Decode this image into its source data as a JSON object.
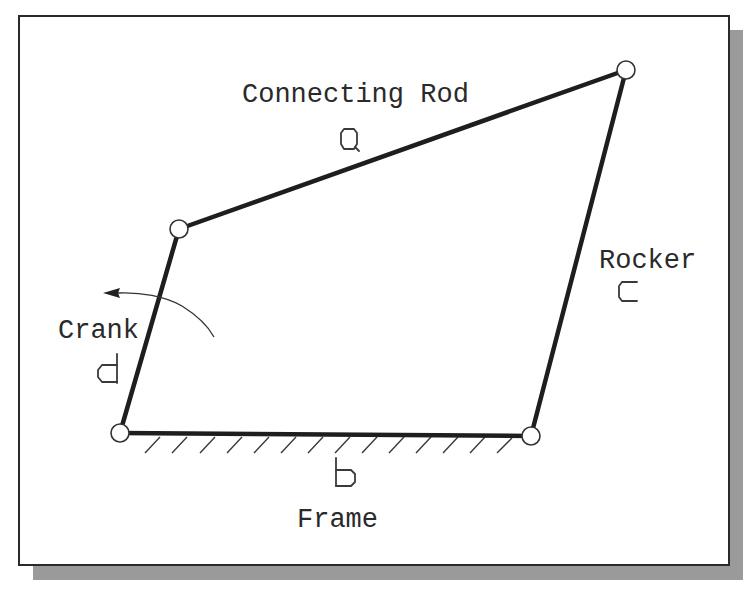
{
  "diagram": {
    "type": "four-bar linkage",
    "links": [
      {
        "id": "connecting-rod",
        "name": "Connecting Rod",
        "symbol": "a"
      },
      {
        "id": "rocker",
        "name": "Rocker",
        "symbol": "c"
      },
      {
        "id": "crank",
        "name": "Crank",
        "symbol": "d"
      },
      {
        "id": "frame",
        "name": "Frame",
        "symbol": "b"
      }
    ],
    "labels": {
      "connecting_rod": "Connecting Rod",
      "rocker": "Rocker",
      "crank": "Crank",
      "frame": "Frame"
    },
    "symbols": {
      "connecting_rod": "a",
      "rocker": "c",
      "crank": "d",
      "frame": "b"
    },
    "joints": [
      {
        "id": "crank-rod",
        "x": 179,
        "y": 229
      },
      {
        "id": "rod-rocker",
        "x": 626,
        "y": 70
      },
      {
        "id": "crank-frame",
        "x": 120,
        "y": 433
      },
      {
        "id": "rocker-frame",
        "x": 531,
        "y": 436
      }
    ],
    "colors": {
      "line": "#1e1e1e",
      "shadow": "#9a9a9a",
      "background": "#ffffff"
    }
  }
}
